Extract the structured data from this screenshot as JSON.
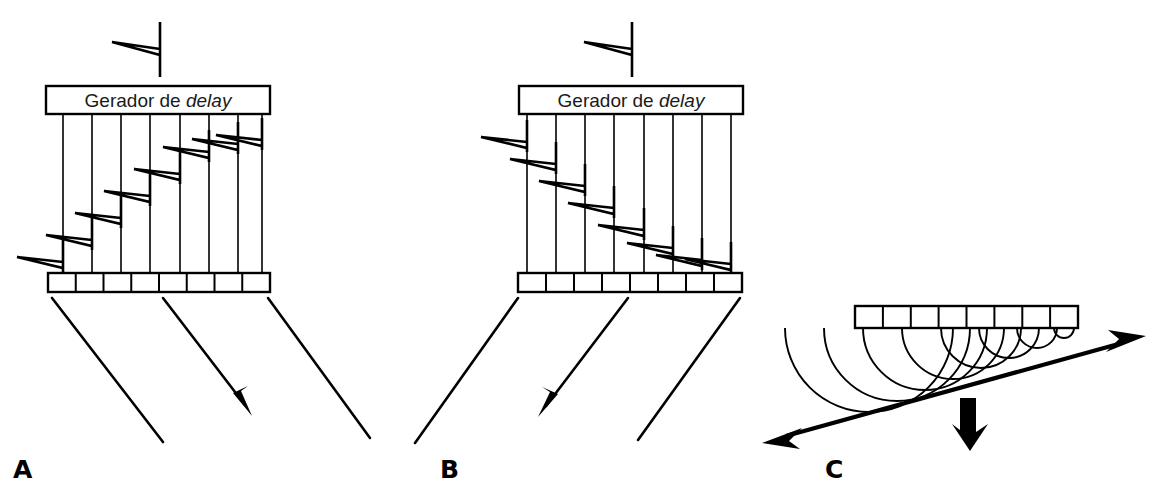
{
  "figure": {
    "background_color": "#ffffff",
    "stroke_color": "#000000",
    "width": 1161,
    "height": 496
  },
  "panels": [
    {
      "id": "A",
      "label": "A",
      "label_x": 13,
      "label_y": 478,
      "delay_box": {
        "label_prefix": "Gerador de ",
        "label_emphasis": "delay",
        "x": 46,
        "y": 86,
        "width": 224,
        "height": 28
      },
      "input_pulse": {
        "x": 112,
        "y": 22,
        "direction": "left",
        "stem_height": 55
      },
      "channel_count": 8,
      "channels_x": [
        63,
        92,
        121,
        150,
        180,
        209,
        238,
        262
      ],
      "channel_top": 114,
      "channel_bottom": 273,
      "pulse_heights": [
        262,
        240,
        218,
        196,
        174,
        152,
        130,
        122
      ],
      "pulse_direction": "left",
      "delay_profile": "increasing-left-to-right",
      "array": {
        "x": 48,
        "y": 273,
        "width": 222,
        "height": 19,
        "elements": 8
      },
      "beams": [
        {
          "x1": 52,
          "y1": 298,
          "x2": 163,
          "y2": 442,
          "arrow": false
        },
        {
          "x1": 163,
          "y1": 298,
          "x2": 250,
          "y2": 412,
          "arrow": true
        },
        {
          "x1": 268,
          "y1": 298,
          "x2": 370,
          "y2": 438,
          "arrow": false
        }
      ],
      "beam_direction": "down-right"
    },
    {
      "id": "B",
      "label": "B",
      "label_x": 440,
      "label_y": 478,
      "delay_box": {
        "label_prefix": "Gerador de ",
        "label_emphasis": "delay",
        "x": 519,
        "y": 86,
        "width": 224,
        "height": 28
      },
      "input_pulse": {
        "x": 584,
        "y": 22,
        "direction": "left",
        "stem_height": 55
      },
      "channel_count": 8,
      "channels_x": [
        527,
        556,
        585,
        614,
        644,
        673,
        702,
        731
      ],
      "channel_top": 114,
      "channel_bottom": 273,
      "pulse_heights": [
        142,
        160,
        180,
        198,
        216,
        234,
        252,
        268
      ],
      "pulse_direction": "left",
      "delay_profile": "decreasing-left-to-right",
      "array": {
        "x": 518,
        "y": 273,
        "width": 224,
        "height": 19,
        "elements": 8
      },
      "beams": [
        {
          "x1": 518,
          "y1": 298,
          "x2": 415,
          "y2": 443,
          "arrow": false
        },
        {
          "x1": 628,
          "y1": 298,
          "x2": 540,
          "y2": 413,
          "arrow": true
        },
        {
          "x1": 740,
          "y1": 298,
          "x2": 638,
          "y2": 440,
          "arrow": false
        }
      ],
      "beam_direction": "down-left"
    },
    {
      "id": "C",
      "label": "C",
      "label_x": 825,
      "label_y": 478,
      "array": {
        "x": 855,
        "y": 306,
        "width": 223,
        "height": 22,
        "elements": 8
      },
      "wavelets": {
        "count": 8,
        "centers_x": [
          869,
          897,
          925,
          953,
          981,
          1009,
          1037,
          1064
        ],
        "center_y": 328,
        "radii": [
          84,
          73,
          62,
          51,
          40,
          30,
          20,
          10
        ],
        "description": "huygens-wavelets-decreasing-radius"
      },
      "wavefront_line": {
        "x1": 779,
        "y1": 438,
        "x2": 1128,
        "y2": 341,
        "arrow_start": "right-pointing-arrowhead",
        "arrow_end": "left-pointing-arrowhead"
      },
      "propagation_arrow": {
        "x": 968,
        "y_start": 398,
        "y_end": 448,
        "direction": "down",
        "style": "thick-solid"
      }
    }
  ]
}
